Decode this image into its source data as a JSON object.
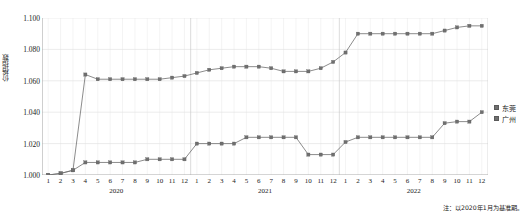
{
  "chart_data": {
    "type": "line",
    "title": "",
    "xlabel": "",
    "ylabel": "价格指数",
    "ylim": [
      1.0,
      1.1
    ],
    "yticks": [
      1.0,
      1.02,
      1.04,
      1.06,
      1.08,
      1.1
    ],
    "ytick_labels": [
      "1.000",
      "1.020",
      "1.040",
      "1.060",
      "1.080",
      "1.100"
    ],
    "grid": true,
    "legend_position": "right",
    "years": [
      "2020",
      "2021",
      "2022"
    ],
    "months": [
      1,
      2,
      3,
      4,
      5,
      6,
      7,
      8,
      9,
      10,
      11,
      12
    ],
    "categories": [
      "2020-1",
      "2020-2",
      "2020-3",
      "2020-4",
      "2020-5",
      "2020-6",
      "2020-7",
      "2020-8",
      "2020-9",
      "2020-10",
      "2020-11",
      "2020-12",
      "2021-1",
      "2021-2",
      "2021-3",
      "2021-4",
      "2021-5",
      "2021-6",
      "2021-7",
      "2021-8",
      "2021-9",
      "2021-10",
      "2021-11",
      "2021-12",
      "2022-1",
      "2022-2",
      "2022-3",
      "2022-4",
      "2022-5",
      "2022-6",
      "2022-7",
      "2022-8",
      "2022-9",
      "2022-10",
      "2022-11",
      "2022-12"
    ],
    "series": [
      {
        "name": "东莞",
        "color": "#6f6f6f",
        "values": [
          1.0,
          1.001,
          1.003,
          1.064,
          1.061,
          1.061,
          1.061,
          1.061,
          1.061,
          1.061,
          1.062,
          1.063,
          1.065,
          1.067,
          1.068,
          1.069,
          1.069,
          1.069,
          1.068,
          1.066,
          1.066,
          1.066,
          1.068,
          1.072,
          1.078,
          1.09,
          1.09,
          1.09,
          1.09,
          1.09,
          1.09,
          1.09,
          1.092,
          1.094,
          1.095,
          1.095
        ]
      },
      {
        "name": "广州",
        "color": "#6f6f6f",
        "values": [
          1.0,
          1.001,
          1.003,
          1.008,
          1.008,
          1.008,
          1.008,
          1.008,
          1.01,
          1.01,
          1.01,
          1.01,
          1.02,
          1.02,
          1.02,
          1.02,
          1.024,
          1.024,
          1.024,
          1.024,
          1.024,
          1.013,
          1.013,
          1.013,
          1.021,
          1.024,
          1.024,
          1.024,
          1.024,
          1.024,
          1.024,
          1.024,
          1.033,
          1.034,
          1.034,
          1.04
        ]
      }
    ],
    "note": "注：以2020年1月为基准期。"
  }
}
